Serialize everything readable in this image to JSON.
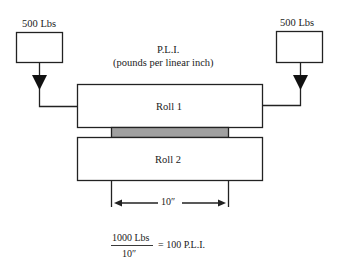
{
  "title": {
    "line1": "P.L.I.",
    "line2": "(pounds per linear inch)"
  },
  "loads": {
    "left": {
      "label": "500 Lbs"
    },
    "right": {
      "label": "500 Lbs"
    }
  },
  "rolls": [
    {
      "label": "Roll 1"
    },
    {
      "label": "Roll 2"
    }
  ],
  "dimension": {
    "label": "10″"
  },
  "formula": {
    "numerator": "1000 Lbs",
    "denominator": "10″",
    "result": "= 100 P.L.I."
  },
  "colors": {
    "line": "#222222",
    "nip": "#a0a0a0",
    "background": "#ffffff"
  }
}
